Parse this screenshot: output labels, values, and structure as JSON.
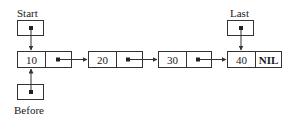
{
  "diagram": {
    "type": "singly-linked-list",
    "pointers": {
      "start": {
        "label": "Start",
        "points_to": "node-0"
      },
      "last": {
        "label": "Last",
        "points_to": "node-3"
      },
      "before": {
        "label": "Before",
        "points_to": "node-0"
      }
    },
    "nodes": [
      {
        "value": "10",
        "next": "pointer"
      },
      {
        "value": "20",
        "next": "pointer"
      },
      {
        "value": "30",
        "next": "pointer"
      },
      {
        "value": "40",
        "next": "NIL"
      }
    ],
    "colors": {
      "line": "#333333",
      "background": "#ffffff",
      "text": "#1a1a1a"
    }
  }
}
